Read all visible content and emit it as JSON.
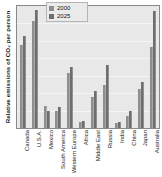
{
  "chart_data": {
    "type": "bar",
    "title": "",
    "subtitle": "",
    "xlabel": "",
    "ylabel": "Relative emissions of CO₂ per person",
    "ylim": [
      0,
      100
    ],
    "grid": true,
    "legend_position": "top-center",
    "axis_ticks_visible": false,
    "categories": [
      "Canada",
      "U.S.A.",
      "Mexico",
      "South America",
      "Western Europe",
      "Africa",
      "Middle East",
      "Russia",
      "India",
      "China",
      "Japan",
      "Australia"
    ],
    "series": [
      {
        "name": "2000",
        "color": "#8e8e8e",
        "values": [
          68,
          88,
          18,
          14,
          45,
          5,
          25,
          35,
          4,
          10,
          32,
          66
        ]
      },
      {
        "name": "2025",
        "color": "#6e6e6e",
        "values": [
          75,
          97,
          14,
          17,
          50,
          6,
          30,
          52,
          5,
          14,
          38,
          96
        ]
      }
    ]
  },
  "legend": {
    "entries": [
      {
        "label": "2000",
        "color": "#8e8e8e"
      },
      {
        "label": "2025",
        "color": "#6e6e6e"
      }
    ]
  },
  "style": {
    "plot_background": "#e8e8e8",
    "frame_border": "#8a8a8a",
    "gridline_color": "#f4f4f4",
    "page_background": "#ffffff",
    "text_color": "#1a1a1a"
  }
}
